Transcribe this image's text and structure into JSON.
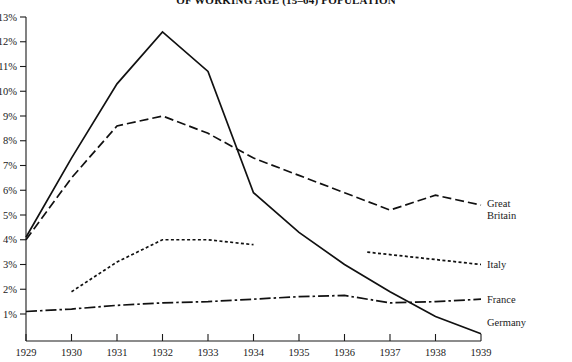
{
  "chart_data": {
    "type": "line",
    "title": "OF WORKING AGE (15–64) POPULATION",
    "xlabel": "",
    "ylabel": "",
    "xlim": [
      1929,
      1939
    ],
    "ylim": [
      0,
      13
    ],
    "grid": false,
    "legend_position": "right-inline",
    "x": [
      1929,
      1930,
      1931,
      1932,
      1933,
      1934,
      1935,
      1936,
      1937,
      1938,
      1939
    ],
    "xtick_labels": [
      "1929",
      "1930",
      "1931",
      "1932",
      "1933",
      "1934",
      "1935",
      "1936",
      "1937",
      "1938",
      "1939"
    ],
    "ytick_labels": [
      "1%",
      "2%",
      "3%",
      "4%",
      "5%",
      "6%",
      "7%",
      "8%",
      "9%",
      "10%",
      "11%",
      "12%",
      "13%"
    ],
    "ytick_values": [
      1,
      2,
      3,
      4,
      5,
      6,
      7,
      8,
      9,
      10,
      11,
      12,
      13
    ],
    "series": [
      {
        "name": "Germany",
        "label": "Germany",
        "style": "solid",
        "x": [
          1929,
          1930,
          1931,
          1932,
          1933,
          1934,
          1935,
          1936,
          1937,
          1938,
          1939
        ],
        "values": [
          4.1,
          7.3,
          10.3,
          12.4,
          10.8,
          5.9,
          4.3,
          3.0,
          1.9,
          0.9,
          0.2
        ]
      },
      {
        "name": "Great Britain",
        "label": "Great Britain",
        "style": "dashed",
        "x": [
          1929,
          1930,
          1931,
          1932,
          1933,
          1934,
          1935,
          1936,
          1937,
          1938,
          1939
        ],
        "values": [
          4.0,
          6.5,
          8.6,
          9.0,
          8.3,
          7.3,
          6.6,
          5.9,
          5.2,
          5.8,
          5.4
        ]
      },
      {
        "name": "Italy",
        "label": "Italy",
        "style": "dotted",
        "x": [
          1929,
          1930,
          1931,
          1932,
          1933,
          1934,
          1936.5,
          1937,
          1938,
          1939
        ],
        "values": [
          null,
          1.9,
          3.1,
          4.0,
          4.0,
          3.8,
          3.5,
          3.4,
          3.2,
          3.0
        ],
        "gap_after_x": 1934,
        "resume_at_x": 1936.5
      },
      {
        "name": "France",
        "label": "France",
        "style": "dash-dot",
        "x": [
          1929,
          1930,
          1931,
          1932,
          1933,
          1934,
          1935,
          1936,
          1937,
          1938,
          1939
        ],
        "values": [
          1.1,
          1.2,
          1.35,
          1.45,
          1.5,
          1.6,
          1.7,
          1.75,
          1.45,
          1.5,
          1.6
        ]
      }
    ]
  },
  "labels": {
    "great_britain_line1": "Great",
    "great_britain_line2": "Britain",
    "italy": "Italy",
    "france": "France",
    "germany": "Germany"
  }
}
